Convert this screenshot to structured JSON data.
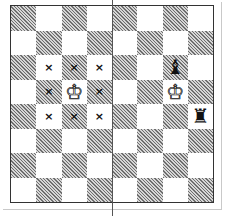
{
  "diagram": {
    "type": "chess-board",
    "orientation": "white-bottom",
    "colors": {
      "light": "#ffffff",
      "dark_hatch": "#6e6e6e",
      "border": "#333333"
    },
    "divider_after_file": "d",
    "left_panel": {
      "description": "King with its eight adjacent squares marked",
      "pieces": [
        {
          "square": "c5",
          "piece": "K",
          "color": "white",
          "glyph": "♔"
        }
      ],
      "marks": [
        {
          "square": "b6",
          "glyph": "×"
        },
        {
          "square": "c6",
          "glyph": "×"
        },
        {
          "square": "d6",
          "glyph": "×"
        },
        {
          "square": "b5",
          "glyph": "×"
        },
        {
          "square": "d5",
          "glyph": "×"
        },
        {
          "square": "b4",
          "glyph": "×"
        },
        {
          "square": "c4",
          "glyph": "×"
        },
        {
          "square": "d4",
          "glyph": "×"
        }
      ]
    },
    "right_panel": {
      "pieces": [
        {
          "square": "g6",
          "piece": "B",
          "color": "black",
          "glyph": "♝"
        },
        {
          "square": "g5",
          "piece": "K",
          "color": "white",
          "glyph": "♔"
        },
        {
          "square": "h4",
          "piece": "R",
          "color": "black",
          "glyph": "♜"
        }
      ]
    }
  }
}
